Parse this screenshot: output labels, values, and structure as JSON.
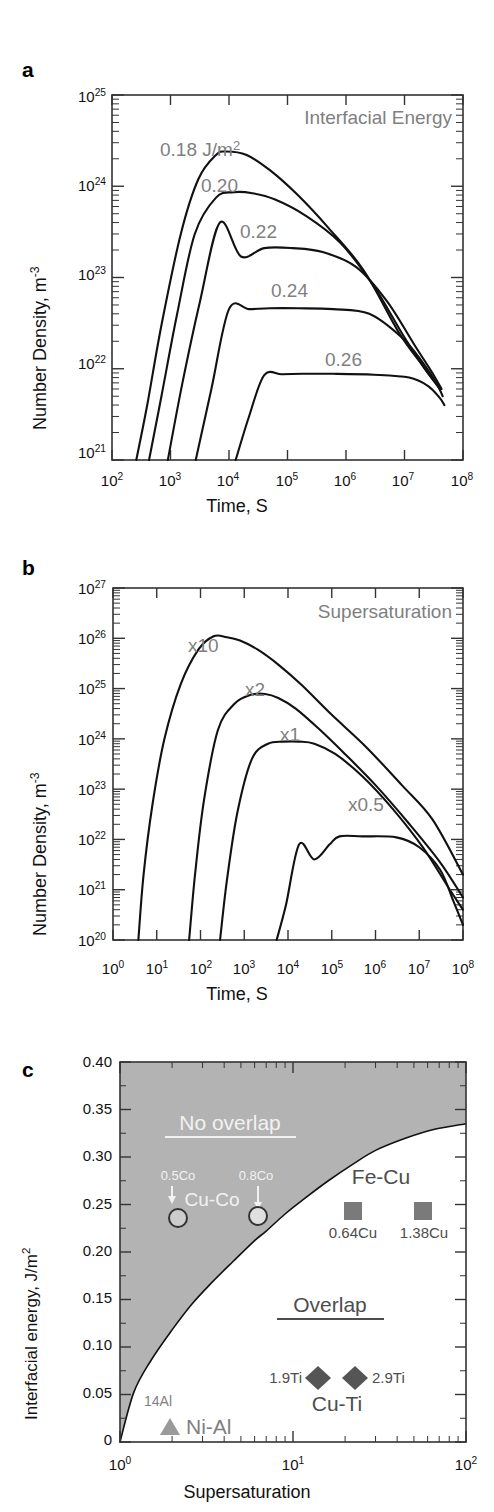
{
  "figure": {
    "panels": [
      "a",
      "b",
      "c"
    ]
  },
  "panel_a": {
    "letter": "a",
    "legend_title": "Interfacial Energy",
    "ylabel_main": "Number Density, m",
    "ylabel_sup": "-3",
    "xlabel": "Time, S",
    "y_ticks": [
      "10",
      "10",
      "10",
      "10",
      "10"
    ],
    "y_tick_exps": [
      "21",
      "22",
      "23",
      "24",
      "25"
    ],
    "x_ticks": [
      "10",
      "10",
      "10",
      "10",
      "10",
      "10",
      "10"
    ],
    "x_tick_exps": [
      "2",
      "3",
      "4",
      "5",
      "6",
      "7",
      "8"
    ],
    "curve_labels": [
      "0.18 J/m",
      "0.20",
      "0.22",
      "0.24",
      "0.26"
    ],
    "curve_label_sup": "2"
  },
  "panel_b": {
    "letter": "b",
    "legend_title": "Supersaturation",
    "ylabel_main": "Number Density, m",
    "ylabel_sup": "-3",
    "xlabel": "Time, S",
    "y_ticks": [
      "10",
      "10",
      "10",
      "10",
      "10",
      "10",
      "10",
      "10"
    ],
    "y_tick_exps": [
      "20",
      "21",
      "22",
      "23",
      "24",
      "25",
      "26",
      "27"
    ],
    "x_ticks": [
      "10",
      "10",
      "10",
      "10",
      "10",
      "10",
      "10",
      "10",
      "10"
    ],
    "x_tick_exps": [
      "0",
      "1",
      "2",
      "3",
      "4",
      "5",
      "6",
      "7",
      "8"
    ],
    "curve_labels": [
      "x10",
      "x2",
      "x1",
      "x0.5"
    ]
  },
  "panel_c": {
    "letter": "c",
    "ylabel_main": "Interfacial energy, J/m",
    "ylabel_sup": "2",
    "xlabel": "Supersaturation",
    "y_ticks": [
      "0",
      "0.05",
      "0.10",
      "0.15",
      "0.20",
      "0.25",
      "0.30",
      "0.35",
      "0.40"
    ],
    "x_ticks": [
      "10",
      "10",
      "10"
    ],
    "x_tick_exps": [
      "0",
      "1",
      "2"
    ],
    "region_labels": {
      "no_overlap": "No overlap",
      "overlap": "Overlap"
    },
    "series_labels": {
      "cu_co": "Cu-Co",
      "fe_cu": "Fe-Cu",
      "cu_ti": "Cu-Ti",
      "ni_al": "Ni-Al"
    },
    "point_labels": {
      "co_low": "0.5Co",
      "co_high": "0.8Co",
      "cu_low": "0.64Cu",
      "cu_high": "1.38Cu",
      "ti_low": "1.9Ti",
      "ti_high": "2.9Ti",
      "al": "14Al"
    }
  },
  "colors": {
    "curve": "#111111",
    "annotation_gray": "#7f7f7f",
    "annotation_white": "#f2f2f2",
    "shaded_region": "#b3b3b3",
    "marker_fill": "#7a7a7a",
    "axis": "#333333"
  },
  "chart_data": [
    {
      "type": "line",
      "panel": "a",
      "title": "Interfacial Energy",
      "xlabel": "Time, S",
      "ylabel": "Number Density, m^-3",
      "xscale": "log",
      "yscale": "log",
      "xlim": [
        100,
        100000000
      ],
      "ylim": [
        1e+21,
        1e+25
      ],
      "grid": false,
      "legend_position": "inline-labels",
      "series": [
        {
          "name": "0.18 J/m^2",
          "x": [
            260,
            400,
            700,
            1500,
            3000,
            6000,
            9000,
            20000,
            50000,
            150000,
            500000,
            2000000,
            8000000,
            20000000,
            40000000
          ],
          "y": [
            1e+21,
            4e+21,
            3e+22,
            3e+23,
            1.2e+24,
            2.2e+24,
            2.4e+24,
            2.2e+24,
            1.5e+24,
            8e+23,
            3.5e+23,
            1.2e+23,
            2.5e+22,
            1.1e+22,
            6e+21
          ]
        },
        {
          "name": "0.20",
          "x": [
            430,
            700,
            1300,
            2600,
            6000,
            12000,
            25000,
            60000,
            200000,
            800000,
            3000000,
            10000000,
            25000000,
            42000000
          ],
          "y": [
            1e+21,
            5e+21,
            4e+22,
            3e+23,
            7.5e+23,
            8.6e+23,
            8.4e+23,
            7.2e+23,
            4.8e+23,
            2.4e+23,
            8e+22,
            2.2e+22,
            9e+21,
            6e+21
          ]
        },
        {
          "name": "0.22",
          "x": [
            900,
            1600,
            3200,
            7000,
            16000,
            40000,
            120000,
            400000,
            1500000,
            5000000,
            15000000,
            30000000,
            43000000
          ],
          "y": [
            1e+21,
            7e+21,
            5.5e+22,
            4e+23,
            1.7e+23,
            2.1e+23,
            2.1e+23,
            1.9e+23,
            1.3e+23,
            5.5e+22,
            1.8e+22,
            9e+21,
            6e+21
          ]
        },
        {
          "name": "0.24",
          "x": [
            2700,
            5000,
            10000,
            22000,
            50000,
            150000,
            600000,
            2500000,
            9000000,
            20000000,
            35000000,
            45000000
          ],
          "y": [
            1e+21,
            6e+21,
            4.5e+22,
            4.5e+22,
            4.6e+22,
            4.6e+22,
            4.5e+22,
            4e+22,
            2.2e+22,
            1.2e+22,
            7e+21,
            5e+21
          ]
        },
        {
          "name": "0.26",
          "x": [
            13000,
            22000,
            40000,
            80000,
            180000,
            600000,
            3000000,
            12000000,
            25000000,
            40000000,
            48000000
          ],
          "y": [
            1e+21,
            3e+21,
            8.5e+21,
            8.7e+21,
            8.8e+21,
            8.8e+21,
            8.6e+21,
            8e+21,
            6.5e+21,
            4.8e+21,
            4e+21
          ]
        }
      ]
    },
    {
      "type": "line",
      "panel": "b",
      "title": "Supersaturation",
      "xlabel": "Time, S",
      "ylabel": "Number Density, m^-3",
      "xscale": "log",
      "yscale": "log",
      "xlim": [
        1,
        100000000
      ],
      "ylim": [
        1e+20,
        1e+27
      ],
      "grid": false,
      "legend_position": "inline-labels",
      "series": [
        {
          "name": "x10",
          "x": [
            3.8,
            5,
            8,
            15,
            35,
            90,
            200,
            400,
            800,
            2000,
            6000,
            20000,
            100000,
            600000,
            4000000,
            20000000,
            100000000
          ],
          "y": [
            1e+20,
            2e+21,
            5e+22,
            1e+24,
            1.2e+25,
            6e+25,
            1.1e+26,
            1.05e+26,
            9e+25,
            6e+25,
            3e+25,
            1.2e+25,
            3e+24,
            7e+23,
            1.2e+23,
            2.5e+22,
            2e+21
          ]
        },
        {
          "name": "x2",
          "x": [
            55,
            75,
            120,
            250,
            600,
            1400,
            3000,
            6000,
            15000,
            50000,
            200000,
            1000000,
            6000000,
            30000000,
            100000000
          ],
          "y": [
            1e+20,
            2e+21,
            6e+22,
            1.5e+24,
            5e+24,
            7.5e+24,
            7.8e+24,
            6.5e+24,
            4e+24,
            1.6e+24,
            5e+23,
            1.2e+23,
            2e+22,
            3.5e+21,
            7e+20
          ]
        },
        {
          "name": "x1",
          "x": [
            280,
            400,
            700,
            1500,
            3500,
            8000,
            18000,
            40000,
            120000,
            500000,
            2500000,
            12000000,
            50000000,
            100000000
          ],
          "y": [
            1e+20,
            1.5e+21,
            3.5e+22,
            4e+23,
            8e+23,
            8.8e+23,
            8.8e+23,
            8e+23,
            5e+23,
            1.8e+23,
            4e+22,
            7e+21,
            1e+21,
            4e+20
          ]
        },
        {
          "name": "x0.5",
          "x": [
            5500,
            9000,
            18000,
            40000,
            90000,
            150000,
            500000,
            3000000,
            10000000,
            30000000,
            60000000,
            100000000
          ],
          "y": [
            1e+20,
            5e+20,
            8e+21,
            4e+21,
            8e+21,
            1.15e+22,
            1.15e+22,
            1.1e+22,
            7e+21,
            2.5e+21,
            6e+20,
            2e+20
          ]
        }
      ]
    },
    {
      "type": "scatter",
      "panel": "c",
      "title": "",
      "xlabel": "Supersaturation",
      "ylabel": "Interfacial energy, J/m^2",
      "xscale": "log",
      "yscale": "linear",
      "xlim": [
        1,
        100
      ],
      "ylim": [
        0,
        0.4
      ],
      "grid": false,
      "boundary_curve": {
        "name": "overlap-boundary",
        "x": [
          1.0,
          1.2,
          1.5,
          2.0,
          2.6,
          3.4,
          4.5,
          6.0,
          7.0,
          9.0,
          12,
          16,
          22,
          30,
          45,
          65,
          100
        ],
        "y": [
          0.0,
          0.052,
          0.085,
          0.118,
          0.145,
          0.168,
          0.19,
          0.212,
          0.222,
          0.24,
          0.258,
          0.275,
          0.292,
          0.307,
          0.32,
          0.329,
          0.335
        ]
      },
      "regions": [
        {
          "label": "No overlap",
          "above_boundary": true,
          "fill": "#b3b3b3"
        },
        {
          "label": "Overlap",
          "above_boundary": false,
          "fill": "#ffffff"
        }
      ],
      "points": [
        {
          "label": "0.5Co",
          "group": "Cu-Co",
          "marker": "circle",
          "x": 2.1,
          "y": 0.22
        },
        {
          "label": "0.8Co",
          "group": "Cu-Co",
          "marker": "circle",
          "x": 6.8,
          "y": 0.22
        },
        {
          "label": "0.64Cu",
          "group": "Fe-Cu",
          "marker": "square",
          "x": 18,
          "y": 0.25
        },
        {
          "label": "1.38Cu",
          "group": "Fe-Cu",
          "marker": "square",
          "x": 45,
          "y": 0.25
        },
        {
          "label": "1.9Ti",
          "group": "Cu-Ti",
          "marker": "diamond",
          "x": 17,
          "y": 0.066
        },
        {
          "label": "2.9Ti",
          "group": "Cu-Ti",
          "marker": "diamond",
          "x": 27,
          "y": 0.066
        },
        {
          "label": "14Al",
          "group": "Ni-Al",
          "marker": "triangle",
          "x": 1.9,
          "y": 0.013
        }
      ]
    }
  ]
}
